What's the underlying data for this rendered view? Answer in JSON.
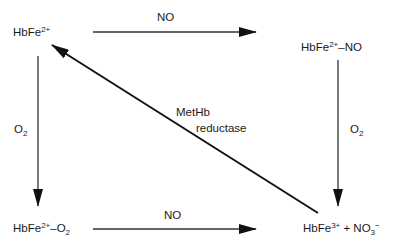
{
  "nodes": {
    "top_left": {
      "base": "HbFe",
      "charge": "2+",
      "suffix": ""
    },
    "top_right": {
      "base": "HbFe",
      "charge": "2+",
      "suffix": "–NO"
    },
    "bottom_left": {
      "base": "HbFe",
      "charge": "2+",
      "suffix": "–O",
      "sub": "2"
    },
    "bottom_right": {
      "base": "HbFe",
      "charge": "3+",
      "plus": " + NO",
      "sub": "3",
      "ion": "−"
    }
  },
  "edges": {
    "top": {
      "label": "NO",
      "from": "HbFe2+",
      "to": "HbFe2+–NO"
    },
    "bottom": {
      "label": "NO",
      "from": "HbFe2+–O2",
      "to": "HbFe3+ + NO3−"
    },
    "left": {
      "label_base": "O",
      "label_sub": "2",
      "from": "HbFe2+",
      "to": "HbFe2+–O2"
    },
    "right": {
      "label_base": "O",
      "label_sub": "2",
      "from": "HbFe2+–NO",
      "to": "HbFe3+ + NO3−"
    },
    "diagonal": {
      "label_line1": "MetHb",
      "label_line2": "reductase",
      "from": "HbFe3+ + NO3−",
      "to": "HbFe2+"
    }
  },
  "colors": {
    "line": "#1a1a1a",
    "background": "#ffffff"
  }
}
